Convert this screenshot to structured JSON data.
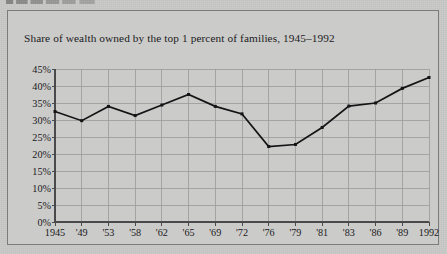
{
  "page": {
    "background_color": "#c9c9c7",
    "figure_border_color": "#7b7b7d",
    "scan_fragment_present": true
  },
  "chart_data": {
    "type": "line",
    "title": "Share of wealth owned by the top 1 percent of families, 1945–1992",
    "xlabel": "",
    "ylabel": "",
    "categories": [
      "1945",
      "'49",
      "'53",
      "'58",
      "'62",
      "'65",
      "'69",
      "'72",
      "'76",
      "'79",
      "'81",
      "'83",
      "'86",
      "'89",
      "1992"
    ],
    "values": [
      32.5,
      29.8,
      34.0,
      31.3,
      34.4,
      37.5,
      34.0,
      31.8,
      22.2,
      22.8,
      27.8,
      34.1,
      35.0,
      39.3,
      42.5
    ],
    "ylim": [
      0,
      45
    ],
    "ytick_values": [
      0,
      5,
      10,
      15,
      20,
      25,
      30,
      35,
      40,
      45
    ],
    "ytick_labels": [
      "0%",
      "5%",
      "10%",
      "15%",
      "20%",
      "25%",
      "30%",
      "35%",
      "40%",
      "45%"
    ],
    "grid": true,
    "grid_color": "#9a9a9c",
    "legend": null,
    "legend_position": "none",
    "series_color": "#141417",
    "marker": "square",
    "marker_size": 3
  }
}
